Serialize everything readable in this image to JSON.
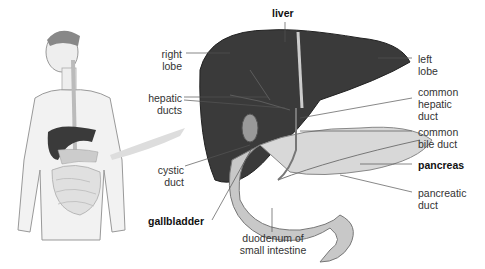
{
  "diagram": {
    "labels": {
      "liver": "liver",
      "right_lobe": [
        "right",
        "lobe"
      ],
      "left_lobe": [
        "left",
        "lobe"
      ],
      "hepatic_ducts": [
        "hepatic",
        "ducts"
      ],
      "common_hepatic_duct": [
        "common",
        "hepatic",
        "duct"
      ],
      "common_bile_duct": [
        "common",
        "bile duct"
      ],
      "pancreas": "pancreas",
      "pancreatic_duct": [
        "pancreatic",
        "duct"
      ],
      "cystic_duct": [
        "cystic",
        "duct"
      ],
      "gallbladder": "gallbladder",
      "duodenum": [
        "duodenum of",
        "small intestine"
      ]
    },
    "colors": {
      "liver": "#3a3a3a",
      "pancreas": "#d8d8d8",
      "duodenum": "#c8c8c8",
      "body": "#f0f0f0",
      "leader_line": "#555555"
    }
  }
}
